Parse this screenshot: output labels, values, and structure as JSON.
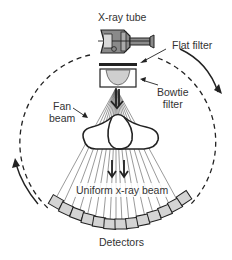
{
  "diagram": {
    "labels": {
      "xray_tube": "X-ray tube",
      "flat_filter": "Flat filter",
      "bowtie_filter_line1": "Bowtie",
      "bowtie_filter_line2": "filter",
      "fan_beam_line1": "Fan",
      "fan_beam_line2": "beam",
      "uniform_beam": "Uniform x-ray beam",
      "detectors": "Detectors"
    },
    "colors": {
      "line": "#222222",
      "detector_fill": "#d4d4d4",
      "bowtie_fill": "#cfcfcf",
      "tube_fill": "#8a8a8a",
      "text": "#333333"
    },
    "detector_count": 13,
    "fan_ray_count": 17
  }
}
